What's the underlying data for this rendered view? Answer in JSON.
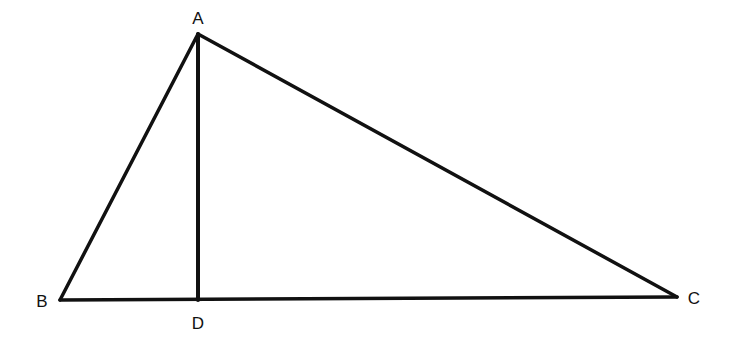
{
  "diagram": {
    "type": "triangle-with-altitude",
    "colors": {
      "stroke": "#111111",
      "background": "#ffffff"
    },
    "points": {
      "A": {
        "label": "A",
        "x": 198,
        "y": 34,
        "label_x": 198,
        "label_y": 24
      },
      "B": {
        "label": "B",
        "x": 60,
        "y": 300,
        "label_x": 42,
        "label_y": 307
      },
      "C": {
        "label": "C",
        "x": 677,
        "y": 297,
        "label_x": 694,
        "label_y": 304
      },
      "D": {
        "label": "D",
        "x": 198,
        "y": 300,
        "label_x": 198,
        "label_y": 329
      }
    },
    "segments": [
      {
        "name": "AB",
        "from": "A",
        "to": "B"
      },
      {
        "name": "AC",
        "from": "A",
        "to": "C"
      },
      {
        "name": "BC",
        "from": "B",
        "to": "C"
      },
      {
        "name": "AD",
        "from": "A",
        "to": "D",
        "role": "altitude"
      }
    ]
  }
}
